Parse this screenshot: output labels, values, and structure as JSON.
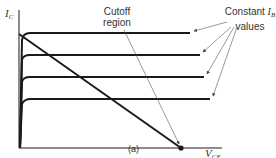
{
  "diagram": {
    "caption": "(a)",
    "y_axis": {
      "symbol": "I",
      "subscript": "C"
    },
    "x_axis": {
      "symbol": "V",
      "subscript": "CE"
    },
    "annotations": {
      "cutoff": {
        "line1": "Cutoff",
        "line2": "region"
      },
      "constant_ib": {
        "line1_prefix": "Constant ",
        "symbol": "I",
        "subscript": "B",
        "line2": "values"
      }
    },
    "curves": [
      {
        "name": "ib-curve-1",
        "y": 33,
        "x_end": 190
      },
      {
        "name": "ib-curve-2",
        "y": 55,
        "x_end": 200
      },
      {
        "name": "ib-curve-3",
        "y": 77,
        "x_end": 204
      },
      {
        "name": "ib-curve-4",
        "y": 99,
        "x_end": 210
      }
    ],
    "load_line": {
      "x1": 19,
      "y1": 34,
      "x2": 181,
      "y2": 148
    },
    "colors": {
      "line": "#1a1a1a",
      "arrow": "#555555"
    }
  }
}
